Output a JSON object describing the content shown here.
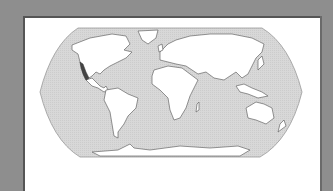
{
  "figure": {
    "type": "world-map",
    "projection": "Robinson",
    "highlighted_region": "West coast of Mexico",
    "colors": {
      "background": "#8e8e8e",
      "panel": "#ffffff",
      "ocean": "#d6d6d6",
      "land": "#ffffff",
      "coastline": "#666666",
      "highlight": "#444444"
    }
  }
}
